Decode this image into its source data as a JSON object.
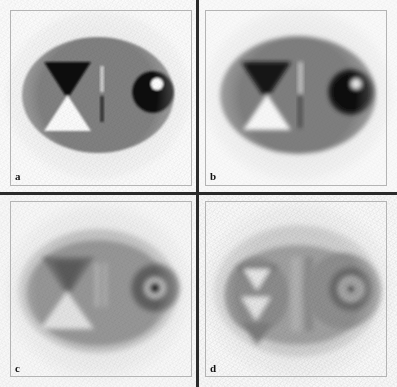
{
  "figure": {
    "layout": "2x2 grid of reconstructed phantom slices",
    "background_color": "#ffffff",
    "divider_color": "#2b2b2b",
    "frame_color": "#b4b4b4"
  },
  "panels": [
    {
      "id": "panel-a",
      "label": "a",
      "position": "top-left",
      "description": "Sharp reconstruction: uniform gray ellipse with high-contrast hourglass, twin line pair and black disc with bright dot",
      "sharpness": "sharp",
      "artifact_level": "low",
      "body_color": "#808080",
      "background_color": "#f4f4f4",
      "features": {
        "triangle_top_color": "#0d0d0d",
        "triangle_bottom_color": "#fafafa",
        "bar_upper_color": "#c9c9c9",
        "bar_lower_color": "#3a3a3a",
        "disc_color": "#080808",
        "disc_highlight_color": "#fdfdfd"
      }
    },
    {
      "id": "panel-b",
      "label": "b",
      "position": "top-right",
      "description": "Moderately blurred reconstruction: same phantom with softened edges and halo around the disc",
      "sharpness": "slightly blurred",
      "artifact_level": "low-medium",
      "body_color": "#7e7e7e",
      "background_color": "#f2f2f2",
      "features": {
        "triangle_top_color": "#131313",
        "triangle_bottom_color": "#f7f7f7",
        "bar_upper_color": "#c2c2c2",
        "bar_lower_color": "#4a4a4a",
        "disc_color": "#0c0c0c",
        "disc_highlight_color": "#e9e9e9"
      }
    },
    {
      "id": "panel-c",
      "label": "c",
      "position": "bottom-left",
      "description": "Low-contrast reconstruction: light outer rim ellipse, washed-out hourglass, faint bar pair and ringed disc",
      "sharpness": "blurred",
      "artifact_level": "medium",
      "body_color": "#969696",
      "rim_color": "#c4c4c4",
      "background_color": "#efefef",
      "features": {
        "triangle_top_color": "#6d6d6d",
        "triangle_bottom_color": "#e2e2e2",
        "bar_upper_color": "#b8b8b8",
        "bar_lower_color": "#7d7d7d",
        "disc_color": "#5e5e5e",
        "disc_highlight_color": "#121212"
      }
    },
    {
      "id": "panel-d",
      "label": "d",
      "position": "bottom-right",
      "description": "Heavily degraded reconstruction: strong ring artifacts, triangles broken into star pattern, concentric rings around the disc",
      "sharpness": "heavily blurred",
      "artifact_level": "high",
      "body_color": "#a0a0a0",
      "rim_color": "#cfcfcf",
      "background_color": "#f0f0f0",
      "features": {
        "triangle_top_color": "#787878",
        "triangle_bottom_color": "#e6e6e6",
        "bar_upper_color": "#b0b0b0",
        "bar_lower_color": "#8a8a8a",
        "disc_color": "#6a6a6a",
        "disc_highlight_color": "#101010"
      }
    }
  ]
}
